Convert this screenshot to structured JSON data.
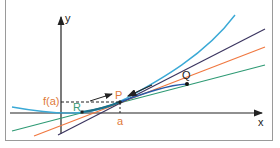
{
  "diagram": {
    "axes": {
      "x_label": "x",
      "y_label": "y"
    },
    "labels": {
      "point_p": "P",
      "point_q": "Q",
      "point_r": "R",
      "x_tick_a": "a",
      "y_tick_fa": "f(a)"
    },
    "colors": {
      "curve": "#3aa9d6",
      "secant_q": "#3b3560",
      "tangent": "#f07840",
      "secant_r": "#2e9a74",
      "accent_label": "#e07a3a",
      "r_label": "#3a9a78",
      "axis": "#222222"
    },
    "elements": [
      {
        "name": "curve f(x)",
        "color": "cyan"
      },
      {
        "name": "secant through P and Q",
        "color": "dark purple"
      },
      {
        "name": "tangent at P",
        "color": "orange"
      },
      {
        "name": "secant through R and P",
        "color": "green"
      }
    ]
  }
}
